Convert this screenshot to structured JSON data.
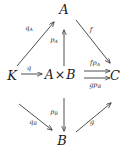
{
  "diagram": {
    "kind": "commutative-diagram",
    "stroke_color": "#3a3a3a",
    "text_color": "#1c1c1c",
    "background": "#ffffff",
    "nodes": [
      {
        "id": "A-top",
        "label": "A",
        "x": 64,
        "y": 9
      },
      {
        "id": "K-left",
        "label": "K",
        "x": 12,
        "y": 75
      },
      {
        "id": "A-times-B",
        "label": "A × B",
        "base": "A",
        "times": "×",
        "second": "B",
        "x": 60,
        "y": 75
      },
      {
        "id": "C-right",
        "label": "C",
        "x": 115,
        "y": 75
      },
      {
        "id": "B-bottom",
        "label": "B",
        "x": 62,
        "y": 140
      }
    ],
    "arrows": [
      {
        "id": "K-to-A-top",
        "from": "K",
        "to": "A",
        "label": "q",
        "sub": "A",
        "label_x": 29,
        "label_y": 28
      },
      {
        "id": "product-to-A-top",
        "from": "A × B",
        "to": "A",
        "label": "p",
        "sub": "A",
        "label_x": 54,
        "label_y": 40
      },
      {
        "id": "A-top-to-C",
        "from": "A",
        "to": "C",
        "label": "f",
        "sub": "",
        "label_x": 91,
        "label_y": 30
      },
      {
        "id": "K-to-product",
        "from": "K",
        "to": "A × B",
        "label": "q",
        "sub": "",
        "label_x": 29,
        "label_y": 68
      },
      {
        "id": "product-to-C-upper",
        "from": "A × B",
        "to": "C",
        "label": "fp",
        "sub": "A",
        "label_x": 95,
        "label_y": 63
      },
      {
        "id": "product-to-C-lower",
        "from": "A × B",
        "to": "C",
        "label": "gp",
        "sub": "B",
        "label_x": 95,
        "label_y": 85
      },
      {
        "id": "K-to-B-bottom",
        "from": "K",
        "to": "B",
        "label": "q",
        "sub": "B",
        "label_x": 33,
        "label_y": 122
      },
      {
        "id": "product-to-B",
        "from": "A × B",
        "to": "B",
        "label": "p",
        "sub": "B",
        "label_x": 54,
        "label_y": 112
      },
      {
        "id": "B-bottom-to-C",
        "from": "B",
        "to": "C",
        "label": "g",
        "sub": "",
        "label_x": 92,
        "label_y": 122
      }
    ]
  }
}
